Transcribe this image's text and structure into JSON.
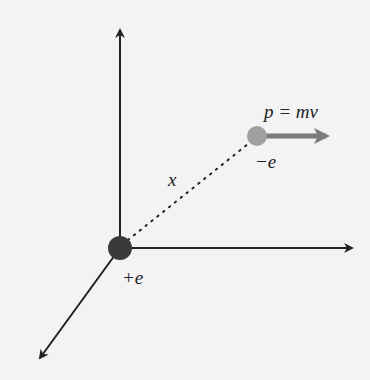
{
  "diagram": {
    "type": "3d-coordinate-system",
    "labels": {
      "momentum": "p = mv",
      "electron_charge": "−e",
      "proton_charge": "+e",
      "distance": "x"
    },
    "colors": {
      "background": "#f3f3f3",
      "axis": "#222222",
      "proton": "#3a3a3a",
      "electron": "#a0a0a0",
      "momentum_arrow": "#7a7a7a",
      "distance_line": "#222222"
    },
    "elements": {
      "proton": {
        "description": "positive charge at origin"
      },
      "electron": {
        "description": "negative charge moving with momentum"
      },
      "axes": [
        "vertical-axis",
        "horizontal-axis",
        "depth-axis"
      ]
    }
  }
}
